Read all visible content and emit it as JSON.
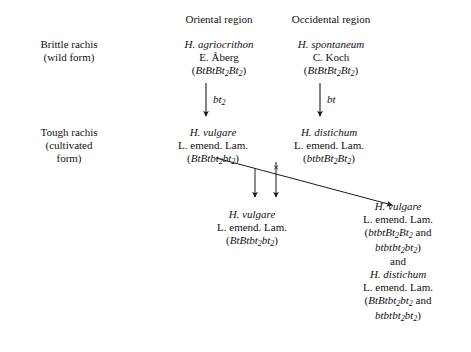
{
  "diagram": {
    "type": "pedigree",
    "headers": [
      {
        "label": "Oriental region",
        "x": 219
      },
      {
        "label": "Occidental region",
        "x": 331
      }
    ],
    "row_labels": [
      {
        "lines": [
          "Brittle rachis",
          "(wild form)"
        ],
        "x": 69,
        "y": 38
      },
      {
        "lines": [
          "Tough rachis",
          "(cultivated",
          "form)"
        ],
        "x": 69,
        "y": 126
      }
    ],
    "taxa": [
      {
        "id": "h-agriocrithon",
        "species": "H. agriocrithon",
        "authority": "E. Åberg",
        "genotype": "(BtBtBt2Bt2)",
        "genotype_html": "(<i>BtBtBt<sub>2</sub>Bt<sub>2</sub></i>)",
        "x": 219,
        "y": 38
      },
      {
        "id": "h-spontaneum",
        "species": "H. spontaneum",
        "authority": "C. Koch",
        "genotype": "(BtBtBt2Bt2)",
        "genotype_html": "(<i>BtBtBt<sub>2</sub>Bt<sub>2</sub></i>)",
        "x": 331,
        "y": 38
      },
      {
        "id": "h-vulgare-oriental",
        "species": "H. vulgare",
        "authority": "L. emend. Lam.",
        "genotype": "(BtBtbt2bt2)",
        "genotype_html": "(<i>BtBtbt<sub>2</sub>bt<sub>2</sub></i>)",
        "x": 213,
        "y": 126
      },
      {
        "id": "h-distichum-occidental",
        "species": "H. distichum",
        "authority": "L. emend. Lam.",
        "genotype": "(btbtBt2Bt2)",
        "genotype_html": "(<i>btbtBt<sub>2</sub>Bt<sub>2</sub></i>)",
        "x": 329,
        "y": 126
      },
      {
        "id": "h-vulgare-hybrid-center",
        "species": "H. vulgare",
        "authority": "L. emend. Lam.",
        "genotype": "(BtBtbt2bt2)",
        "genotype_html": "(<i>BtBtbt<sub>2</sub>bt<sub>2</sub></i>)",
        "x": 252,
        "y": 208
      }
    ],
    "offspring_right": {
      "x": 398,
      "y": 200,
      "entries": [
        {
          "species": "H. vulgare",
          "authority": "L. emend. Lam.",
          "genotype_lines": [
            "(btbtBt2Bt2 and",
            "btbtbt2bt2)"
          ],
          "genotype_html_lines": [
            "(<i>btbtBt<sub>2</sub>Bt<sub>2</sub></i> and",
            "<i>btbtbt<sub>2</sub>bt<sub>2</sub></i>)"
          ]
        },
        {
          "species": "H. distichum",
          "authority": "L. emend. Lam.",
          "genotype_lines": [
            "(BtBtbt2bt2 and",
            "btbtbt2bt2)"
          ],
          "genotype_html_lines": [
            "(<i>BtBtbt<sub>2</sub>bt<sub>2</sub></i> and",
            "<i>btbtbt<sub>2</sub>bt<sub>2</sub></i>)"
          ]
        }
      ],
      "conjunction": "and"
    },
    "mutation_arrows": [
      {
        "id": "bt2-mutation",
        "label": "bt2",
        "label_html": "<i>bt<sub>2</sub></i>",
        "x": 206,
        "y_from": 82,
        "y_to": 116,
        "label_x": 213,
        "label_y": 93
      },
      {
        "id": "bt-mutation",
        "label": "bt",
        "label_html": "<i>bt</i>",
        "x": 320,
        "y_from": 82,
        "y_to": 116,
        "label_x": 327,
        "label_y": 93
      }
    ],
    "cross_symbol": "×",
    "colors": {
      "text": "#111111",
      "line": "#1a1a1a",
      "background": "#ffffff"
    }
  }
}
